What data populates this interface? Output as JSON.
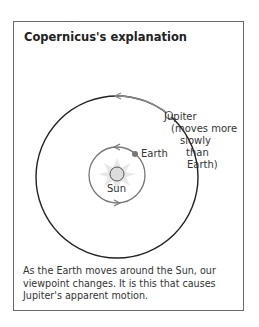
{
  "panel": {
    "title": "Copernicus's explanation",
    "caption": "As the Earth moves around the Sun, our viewpoint changes. It is this that causes Jupiter's apparent motion."
  },
  "labels": {
    "jupiter": "Jupiter",
    "jupiter_note_1": "(moves more",
    "jupiter_note_2": "slowly",
    "jupiter_note_3": "than",
    "jupiter_note_4": "Earth)",
    "earth": "Earth",
    "sun": "Sun"
  },
  "colors": {
    "outer_orbit": "#222222",
    "inner_orbit": "#777777",
    "earth": "#777777",
    "sun_rays": "#e6e6e6",
    "sun_fill": "#dddddd",
    "border": "#6a6a6a"
  }
}
